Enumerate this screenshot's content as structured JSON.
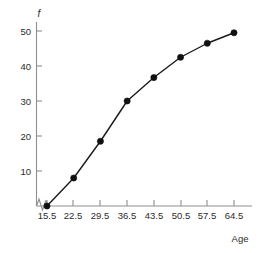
{
  "chart_data": {
    "type": "line",
    "title": "",
    "subtitle": "",
    "xlabel": "Age",
    "ylabel": "f",
    "x": [
      15.5,
      22.5,
      29.5,
      36.5,
      43.5,
      50.5,
      57.5,
      64.5
    ],
    "values": [
      0,
      8,
      18.5,
      30,
      36.7,
      42.5,
      46.5,
      49.5
    ],
    "series": [
      {
        "name": "Cumulative frequency",
        "values": [
          0,
          8,
          18.5,
          30,
          36.7,
          42.5,
          46.5,
          49.5
        ]
      }
    ],
    "categories": [
      "15.5",
      "22.5",
      "29.5",
      "36.5",
      "43.5",
      "50.5",
      "57.5",
      "64.5"
    ],
    "xtick_labels": [
      "15.5",
      "22.5",
      "29.5",
      "36.5",
      "43.5",
      "50.5",
      "57.5",
      "64.5"
    ],
    "ytick_labels": [
      "10",
      "20",
      "30",
      "40",
      "50"
    ],
    "ytick_values": [
      10,
      20,
      30,
      40,
      50
    ],
    "xlim": [
      15.5,
      64.5
    ],
    "ylim": [
      0,
      53
    ],
    "grid": false,
    "legend": false,
    "legend_position": "none",
    "axis_break_x": true,
    "marker": "filled-circle",
    "line_color": "#1a1a1a",
    "marker_color": "#111111",
    "axis_color": "#8f8f8f",
    "background_color": "#ffffff",
    "annotations": []
  },
  "axes": {
    "y_title": "f",
    "x_title": "Age"
  }
}
